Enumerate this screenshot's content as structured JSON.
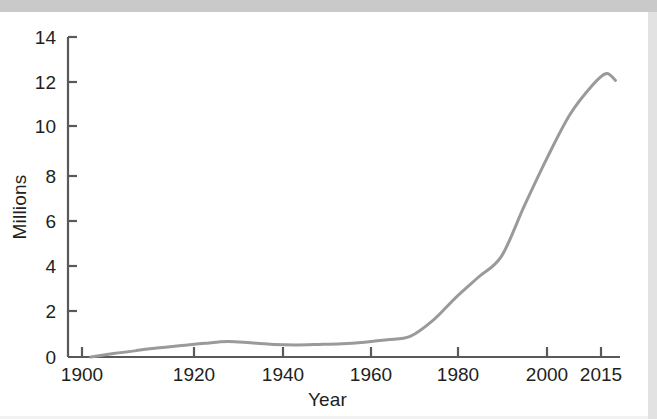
{
  "figure": {
    "background_color": "#ffffff",
    "scan_band_color": "#c9c9c9",
    "axis_color": "#58595b",
    "text_color": "#231f20"
  },
  "chart_data": {
    "type": "line",
    "title": "",
    "subtitle": "",
    "xlabel": "Year",
    "ylabel": "Millions",
    "xlim": [
      1895,
      2016
    ],
    "ylim": [
      0,
      14
    ],
    "grid": false,
    "legend": null,
    "line_color": "#9a9a9a",
    "line_width": 3,
    "x_ticks": [
      1900,
      1920,
      1940,
      1960,
      1980,
      2000,
      2015
    ],
    "x_tick_labels": [
      "1900",
      "1920",
      "1940",
      "1960",
      "1980",
      "2000",
      "2015"
    ],
    "y_ticks": [
      0,
      2,
      4,
      6,
      8,
      10,
      12,
      14
    ],
    "y_tick_labels": [
      "0",
      "2",
      "4",
      "6",
      "8",
      "10",
      "12",
      "14"
    ],
    "series": [
      {
        "name": "Population",
        "x": [
          1900,
          1905,
          1910,
          1915,
          1920,
          1925,
          1930,
          1935,
          1940,
          1945,
          1950,
          1955,
          1960,
          1965,
          1970,
          1975,
          1980,
          1985,
          1990,
          1995,
          2000,
          2005,
          2010,
          2013,
          2015
        ],
        "values": [
          0.0,
          0.15,
          0.28,
          0.4,
          0.5,
          0.6,
          0.68,
          0.62,
          0.55,
          0.53,
          0.55,
          0.58,
          0.65,
          0.75,
          0.9,
          1.6,
          2.6,
          3.5,
          4.4,
          6.6,
          8.7,
          10.6,
          11.9,
          12.4,
          12.1
        ]
      }
    ]
  },
  "axes_geometry": {
    "origin_x": 68,
    "origin_y": 357,
    "top_y": 37,
    "right_x": 620,
    "x_pixel_ticks": [
      82,
      194,
      283,
      371,
      458,
      547,
      601
    ],
    "y_pixel_ticks": [
      357,
      311,
      266,
      221,
      176,
      126,
      82,
      37
    ]
  }
}
